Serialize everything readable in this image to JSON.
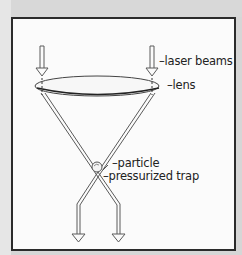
{
  "diagram": {
    "type": "optical trap schematic",
    "labels": {
      "laser_beams": "–laser beams",
      "lens": "–lens",
      "particle": "–particle",
      "pressurized_trap": "–pressurized trap"
    },
    "elements": [
      {
        "name": "laser beam arrows (incoming)",
        "count": 2
      },
      {
        "name": "lens",
        "shape": "ellipse"
      },
      {
        "name": "converging beams",
        "count": 2
      },
      {
        "name": "particle",
        "shape": "circle"
      },
      {
        "name": "outgoing arrows",
        "count": 2
      }
    ],
    "colors": {
      "background": "#d6d6d6",
      "panel": "#fbfbfb",
      "frame": "#2b2b2b",
      "line": "#555555"
    }
  }
}
